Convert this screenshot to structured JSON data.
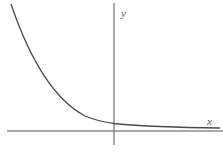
{
  "figure": {
    "x_axis_label": "x",
    "y_axis_label": "y",
    "curve_color": "#4a4a4a",
    "axis_color": "#555555",
    "background": "#ffffff"
  }
}
